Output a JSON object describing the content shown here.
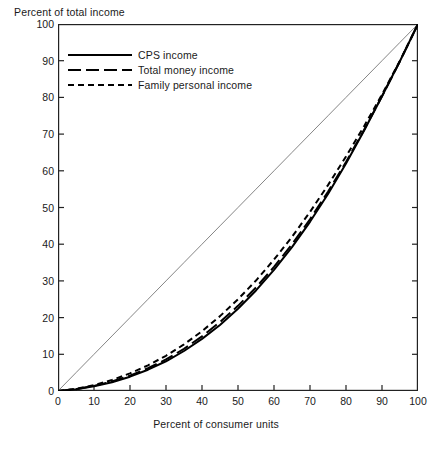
{
  "chart_data": {
    "type": "line",
    "title": "",
    "xlabel": "Percent of consumer units",
    "ylabel": "Percent of total income",
    "xlim": [
      0,
      100
    ],
    "ylim": [
      0,
      100
    ],
    "grid": false,
    "legend_position": "upper left",
    "xticks": [
      "0",
      "10",
      "20",
      "30",
      "40",
      "50",
      "60",
      "70",
      "80",
      "90",
      "100"
    ],
    "yticks": [
      "0",
      "10",
      "20",
      "30",
      "40",
      "50",
      "60",
      "70",
      "80",
      "90",
      "100"
    ],
    "x": [
      0,
      5,
      10,
      15,
      20,
      25,
      30,
      35,
      40,
      45,
      50,
      55,
      60,
      65,
      70,
      75,
      80,
      85,
      90,
      95,
      100
    ],
    "series": [
      {
        "name": "CPS income",
        "style": "solid",
        "values": [
          0,
          0.5,
          1.3,
          2.4,
          3.9,
          5.8,
          8.1,
          10.9,
          14.2,
          18.0,
          22.4,
          27.4,
          33.0,
          39.2,
          46.1,
          53.7,
          62.0,
          70.9,
          80.3,
          89.9,
          100
        ]
      },
      {
        "name": "Total money income",
        "style": "long-dash",
        "values": [
          0,
          0.5,
          1.4,
          2.6,
          4.2,
          6.2,
          8.6,
          11.5,
          14.9,
          18.8,
          23.2,
          28.2,
          33.8,
          40.0,
          46.8,
          54.3,
          62.4,
          71.1,
          80.3,
          89.9,
          100
        ]
      },
      {
        "name": "Family personal income",
        "style": "short-dash",
        "values": [
          0,
          0.6,
          1.6,
          3.0,
          4.8,
          7.0,
          9.6,
          12.7,
          16.3,
          20.4,
          25.0,
          30.1,
          35.8,
          42.0,
          48.8,
          56.1,
          63.9,
          72.1,
          80.8,
          90.0,
          100
        ]
      },
      {
        "name": "line-of-equality",
        "style": "thin-diagonal",
        "values": [
          0,
          5,
          10,
          15,
          20,
          25,
          30,
          35,
          40,
          45,
          50,
          55,
          60,
          65,
          70,
          75,
          80,
          85,
          90,
          95,
          100
        ]
      }
    ],
    "colors": {
      "curves": "#000000",
      "diagonal": "#777777",
      "frame": "#222222",
      "text": "#1a1a1a"
    }
  },
  "legend": {
    "items": [
      {
        "label": "CPS income",
        "style": "solid"
      },
      {
        "label": "Total money income",
        "style": "long-dash"
      },
      {
        "label": "Family personal income",
        "style": "short-dash"
      }
    ]
  }
}
